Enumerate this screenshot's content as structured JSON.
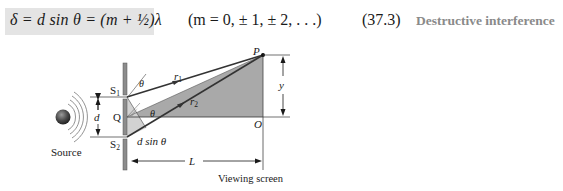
{
  "equation": {
    "formula": "δ = d sin θ = (m + ½)λ",
    "condition": "(m = 0, ± 1, ± 2, . . .)",
    "number": "(37.3)",
    "label": "Destructive interference",
    "box_color": "#e4e4e4",
    "label_color": "#8a8a8a"
  },
  "figure": {
    "labels": {
      "source": "Source",
      "s1": "S",
      "s1_sub": "1",
      "s2": "S",
      "s2_sub": "2",
      "q": "Q",
      "d": "d",
      "theta_top": "θ",
      "theta_mid": "θ",
      "r1": "r",
      "r1_sub": "1",
      "r2": "r",
      "r2_sub": "2",
      "path_diff": "d sin θ",
      "p": "P",
      "o": "O",
      "y": "y",
      "l": "L",
      "screen": "Viewing screen"
    },
    "colors": {
      "triangle_fill": "#a9a9a9",
      "small_triangle_fill": "#d2d2d2",
      "barrier": "#8c8c8c",
      "ray": "#333333"
    }
  }
}
